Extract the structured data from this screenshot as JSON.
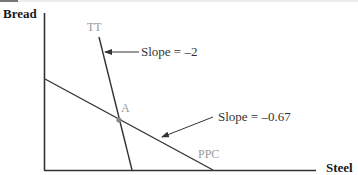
{
  "diagram": {
    "y_axis_label": "Bread",
    "x_axis_label": "Steel",
    "curves": [
      {
        "name": "TT",
        "label": "TT",
        "slope_annotation": "Slope = –2"
      },
      {
        "name": "PPC",
        "label": "PPC",
        "slope_annotation": "Slope = –0.67"
      }
    ],
    "point_label": "A",
    "colors": {
      "lines": "#333333",
      "curve_labels": "#9a9a9a",
      "point": "#888888"
    }
  }
}
